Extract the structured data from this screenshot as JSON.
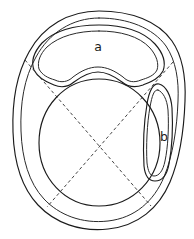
{
  "figure": {
    "background_color": "#ffffff",
    "line_color": "#1b1b1b",
    "dashed_line_color": "#3a3a3a",
    "width": 194,
    "height": 239
  },
  "labels": [
    {
      "id": "label-a",
      "text": "a",
      "x": 98,
      "y": 47
    },
    {
      "id": "label-b",
      "text": "b",
      "x": 164,
      "y": 137
    }
  ],
  "regions": [
    {
      "id": "outer-capsule",
      "name": "outer-capsule-outline",
      "label": ""
    },
    {
      "id": "inner-capsule",
      "name": "inner-capsule-outline",
      "label": ""
    },
    {
      "id": "central-circle",
      "name": "central-circular-region",
      "label": ""
    },
    {
      "id": "region-a",
      "name": "upper-crescent-region",
      "label": "a"
    },
    {
      "id": "region-b",
      "name": "right-elongated-region",
      "label": "b"
    }
  ],
  "axes": [
    {
      "id": "axis-diagonal-1",
      "name": "dashed-diagonal-axis-nw-se",
      "x1": 25,
      "y1": 60,
      "x2": 151,
      "y2": 206
    },
    {
      "id": "axis-diagonal-2",
      "name": "dashed-diagonal-axis-ne-sw",
      "x1": 173,
      "y1": 62,
      "x2": 47,
      "y2": 207
    }
  ]
}
